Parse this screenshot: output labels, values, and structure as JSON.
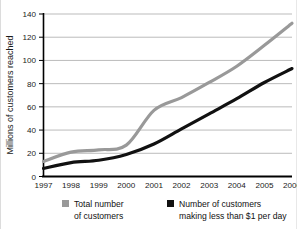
{
  "chart_data": {
    "type": "line",
    "title": "",
    "xlabel": "",
    "ylabel": "Millions of customers reached",
    "categories": [
      "1997",
      "1998",
      "1999",
      "2000",
      "2001",
      "2002",
      "2003",
      "2004",
      "2005",
      "2006"
    ],
    "xlim": [
      1997,
      2006
    ],
    "ylim": [
      0,
      140
    ],
    "yticks": [
      0,
      20,
      40,
      60,
      80,
      100,
      120,
      140
    ],
    "grid": "horizontal",
    "legend_position": "bottom",
    "series": [
      {
        "name": "Total number of customers",
        "color": "#999999",
        "values": [
          13,
          21,
          23,
          27,
          57,
          68,
          81,
          95,
          113,
          132
        ]
      },
      {
        "name": "Number of customers making less than $1 per day",
        "color": "#111111",
        "values": [
          7,
          12,
          14,
          19,
          28,
          41,
          54,
          67,
          81,
          93
        ]
      }
    ]
  },
  "axis": {
    "y_label": "Millions of customers reached",
    "y_ticks": [
      "140",
      "120",
      "100",
      "80",
      "60",
      "40",
      "20",
      "0"
    ],
    "x_ticks": [
      "1997",
      "1998",
      "1999",
      "2000",
      "2001",
      "2002",
      "2003",
      "2004",
      "2005",
      "2006"
    ]
  },
  "legend": {
    "items": [
      {
        "swatch_color": "#999999",
        "line1": "Total number",
        "line2": "of customers"
      },
      {
        "swatch_color": "#111111",
        "line1": "Number of customers",
        "line2": "making less than $1 per day"
      }
    ]
  },
  "colors": {
    "total_series": "#999999",
    "poor_series": "#111111",
    "gridline": "#b3b3b3",
    "axis": "#000000",
    "background": "#ffffff"
  }
}
